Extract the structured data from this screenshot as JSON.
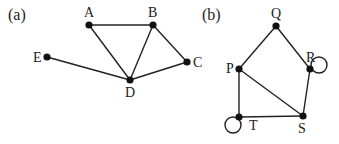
{
  "figure": {
    "graphs": [
      {
        "id": "a",
        "panel_label": "(a)",
        "panel_label_pos": [
          8,
          20
        ],
        "nodes": [
          {
            "id": "A",
            "label": "A",
            "x": 89,
            "y": 25,
            "lx": 84,
            "ly": 17
          },
          {
            "id": "B",
            "label": "B",
            "x": 153,
            "y": 25,
            "lx": 148,
            "ly": 17
          },
          {
            "id": "C",
            "label": "C",
            "x": 187,
            "y": 62,
            "lx": 193,
            "ly": 67
          },
          {
            "id": "D",
            "label": "D",
            "x": 130,
            "y": 80,
            "lx": 125,
            "ly": 97
          },
          {
            "id": "E",
            "label": "E",
            "x": 47,
            "y": 57,
            "lx": 33,
            "ly": 62
          }
        ],
        "edges": [
          [
            "A",
            "B"
          ],
          [
            "A",
            "D"
          ],
          [
            "B",
            "D"
          ],
          [
            "B",
            "C"
          ],
          [
            "C",
            "D"
          ],
          [
            "E",
            "D"
          ]
        ],
        "loops": []
      },
      {
        "id": "b",
        "panel_label": "(b)",
        "panel_label_pos": [
          202,
          20
        ],
        "nodes": [
          {
            "id": "Q",
            "label": "Q",
            "x": 276,
            "y": 26,
            "lx": 271,
            "ly": 18
          },
          {
            "id": "R",
            "label": "R",
            "x": 310,
            "y": 69,
            "lx": 306,
            "ly": 62
          },
          {
            "id": "S",
            "label": "S",
            "x": 303,
            "y": 116,
            "lx": 298,
            "ly": 133
          },
          {
            "id": "T",
            "label": "T",
            "x": 239,
            "y": 117,
            "lx": 249,
            "ly": 130
          },
          {
            "id": "P",
            "label": "P",
            "x": 239,
            "y": 69,
            "lx": 226,
            "ly": 73
          }
        ],
        "edges": [
          [
            "Q",
            "P"
          ],
          [
            "Q",
            "R"
          ],
          [
            "P",
            "T"
          ],
          [
            "P",
            "S"
          ],
          [
            "R",
            "S"
          ],
          [
            "T",
            "S"
          ]
        ],
        "loops": [
          {
            "node": "R",
            "cx": 319,
            "cy": 65,
            "r": 8
          },
          {
            "node": "T",
            "cx": 233,
            "cy": 125,
            "r": 8
          }
        ]
      }
    ]
  }
}
